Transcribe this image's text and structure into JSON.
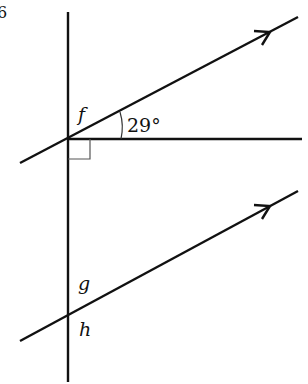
{
  "diagram": {
    "corner_mark": "6",
    "angle_label": "29°",
    "point_labels": {
      "f": "f",
      "g": "g",
      "h": "h"
    },
    "line_color": "#111111",
    "right_angle_color": "#555555",
    "lines": [
      {
        "name": "vertical-transversal",
        "x1": 68,
        "y1": 12,
        "x2": 68,
        "y2": 382
      },
      {
        "name": "horizontal-line",
        "x1": 68,
        "y1": 139,
        "x2": 302,
        "y2": 139
      },
      {
        "name": "upper-parallel-line",
        "x1": 20,
        "y1": 163,
        "x2": 298,
        "y2": 17,
        "arrow": true
      },
      {
        "name": "lower-parallel-line",
        "x1": 20,
        "y1": 341,
        "x2": 298,
        "y2": 191,
        "arrow": true
      }
    ],
    "angles": [
      {
        "label": "29°",
        "between": [
          "horizontal-line",
          "upper-parallel-line"
        ],
        "vertex": [
          68,
          139
        ]
      },
      {
        "label": "90°",
        "type": "right-angle",
        "between": [
          "vertical-transversal",
          "horizontal-line"
        ],
        "vertex": [
          68,
          139
        ]
      }
    ]
  }
}
